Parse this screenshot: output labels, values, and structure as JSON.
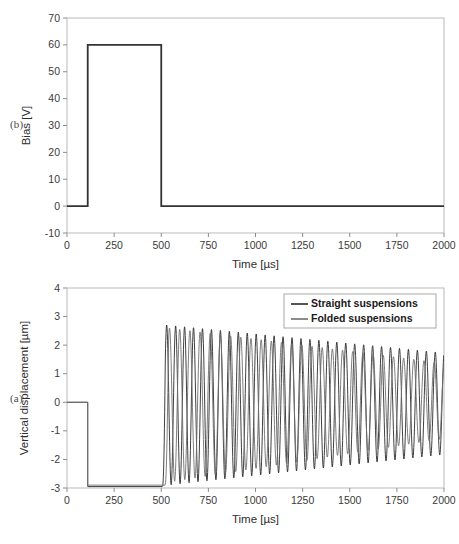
{
  "figure": {
    "panels": [
      {
        "tag": "(b)",
        "name": "bias-panel"
      },
      {
        "tag": "(a)",
        "name": "displacement-panel"
      }
    ]
  },
  "chart_data": [
    {
      "type": "line",
      "name": "bias-waveform",
      "panel_tag": "(b)",
      "title": "",
      "xlabel": "Time [µs]",
      "ylabel": "Bias [V]",
      "xlim": [
        0,
        2000
      ],
      "ylim": [
        -10,
        70
      ],
      "xticks": [
        0,
        250,
        500,
        750,
        1000,
        1250,
        1500,
        1750,
        2000
      ],
      "yticks": [
        -10,
        0,
        10,
        20,
        30,
        40,
        50,
        60,
        70
      ],
      "grid": false,
      "legend": null,
      "series": [
        {
          "name": "Bias pulse",
          "color": "#333333",
          "width": 1.8,
          "x": [
            0,
            110,
            110,
            500,
            500,
            2000
          ],
          "values": [
            0,
            0,
            60,
            60,
            0,
            0
          ]
        }
      ],
      "annotations": {
        "pulse_amplitude_v": 60,
        "pulse_start_us": 110,
        "pulse_end_us": 500,
        "baseline_v": 0
      }
    },
    {
      "type": "line",
      "name": "vertical-displacement-response",
      "panel_tag": "(a)",
      "title": "",
      "xlabel": "Time [µs]",
      "ylabel": "Vertical displacement [µm]",
      "xlim": [
        0,
        2000
      ],
      "ylim": [
        -3,
        4
      ],
      "xticks": [
        0,
        250,
        500,
        750,
        1000,
        1250,
        1500,
        1750,
        2000
      ],
      "yticks": [
        -3,
        -2,
        -1,
        0,
        1,
        2,
        3,
        4
      ],
      "grid": false,
      "legend": {
        "position": "top-right",
        "entries": [
          "Straight suspensions",
          "Folded suspensions"
        ]
      },
      "series": [
        {
          "name": "Straight suspensions",
          "color": "#2a2a2a",
          "width": 0.9,
          "model": "pulldown-then-damped-oscillation",
          "params": {
            "rest_level": 0.0,
            "pulldown_level": -2.95,
            "pulldown_time_us": 110,
            "release_time_us": 505,
            "period_us": 47.5,
            "phase_offset": 0.0,
            "amp_start": 2.82,
            "amp_end": 1.78,
            "center_start": -0.1,
            "center_end": -0.05
          }
        },
        {
          "name": "Folded suspensions",
          "color": "#6f6f6f",
          "width": 0.9,
          "model": "pulldown-then-damped-oscillation",
          "params": {
            "rest_level": 0.0,
            "pulldown_level": -2.9,
            "pulldown_time_us": 110,
            "release_time_us": 520,
            "period_us": 54.0,
            "phase_offset": 0.35,
            "amp_start": 2.72,
            "amp_end": 1.32,
            "center_start": -0.1,
            "center_end": 0.05
          }
        }
      ],
      "annotations": {
        "initial_level_um": 0,
        "pulled_down_level_um": -2.95,
        "oscillation_start_us": 505,
        "peak_amplitude_um": 2.8,
        "final_amplitude_um": 1.8
      }
    }
  ]
}
